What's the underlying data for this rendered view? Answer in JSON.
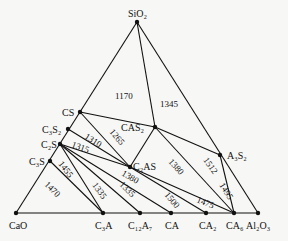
{
  "diagram": {
    "vertices": {
      "top": "SiO₂",
      "left": "CaO",
      "right": "Al₂O₃"
    },
    "points": {
      "SiO2": "SiO₂",
      "CS": "CS",
      "C3S2": "C₃S₂",
      "C2S": "C₂S",
      "C3S": "C₃S",
      "CAS2": "CAS₂",
      "C2AS": "C₂AS",
      "A3S2": "A₃S₂",
      "CaO": "CaO",
      "C3A": "C₃A",
      "C12A7": "C₁₂A₇",
      "CA": "CA",
      "CA2": "CA₂",
      "CA6": "CA₆",
      "Al2O3": "Al₂O₃"
    },
    "temperatures": {
      "t1170": "1170",
      "t1345": "1345",
      "t1310": "1310",
      "t1265": "1265",
      "t1315": "1315",
      "t1380a": "1380",
      "t1380b": "1380",
      "t1512": "1512",
      "t1495": "1495",
      "t1455": "1455",
      "t1470": "1470",
      "t1335a": "1335",
      "t1335b": "1335",
      "t1500": "1500",
      "t1475": "1475"
    }
  }
}
